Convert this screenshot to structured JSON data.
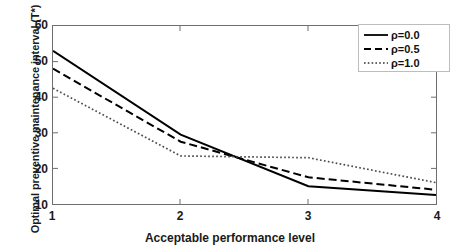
{
  "chart_data": {
    "type": "line",
    "title": "",
    "xlabel": "Acceptable performance level",
    "ylabel": "Optimal preventive maintenance interval (T*)",
    "xlim": [
      1,
      4
    ],
    "ylim": [
      10,
      60
    ],
    "xticks": [
      "1",
      "2",
      "3",
      "4"
    ],
    "yticks": [
      "10",
      "20",
      "30",
      "40",
      "50",
      "60"
    ],
    "grid": false,
    "legend_position": "top-right",
    "x": [
      1,
      2,
      3,
      4
    ],
    "series": [
      {
        "name": "ρ=0.0",
        "rho": "0.0",
        "style": "solid",
        "color": "#000000",
        "values": [
          53,
          29.5,
          15,
          12.5
        ]
      },
      {
        "name": "ρ=0.5",
        "rho": "0.5",
        "style": "dashed",
        "color": "#000000",
        "values": [
          48,
          27.5,
          17.5,
          14
        ]
      },
      {
        "name": "ρ=1.0",
        "rho": "1.0",
        "style": "dotted",
        "color": "#4d4d4d",
        "values": [
          42.5,
          23.5,
          23,
          16
        ]
      }
    ],
    "legend": [
      {
        "label": "ρ=0.0",
        "style": "solid"
      },
      {
        "label": "ρ=0.5",
        "style": "dashed"
      },
      {
        "label": "ρ=1.0",
        "style": "dotted"
      }
    ]
  }
}
